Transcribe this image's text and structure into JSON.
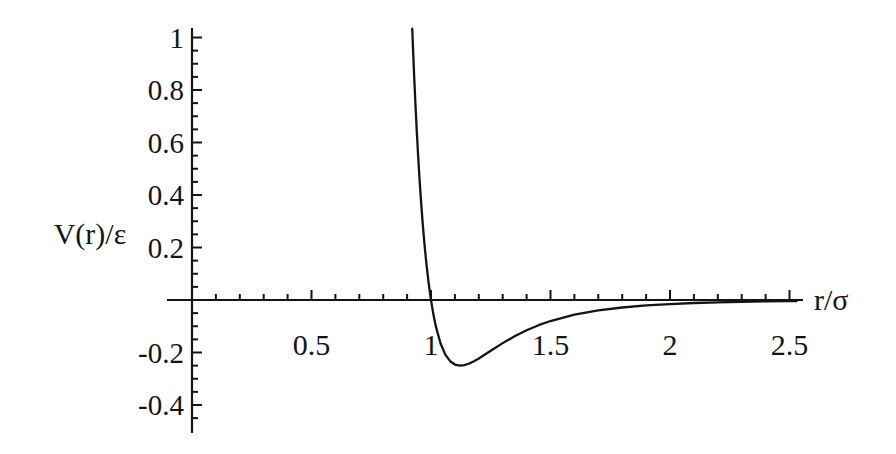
{
  "chart_data": {
    "type": "line",
    "title": "",
    "xlabel": "r/σ",
    "ylabel": "V(r)/ε",
    "xlim": [
      0,
      2.56
    ],
    "ylim": [
      -0.5,
      1.04
    ],
    "grid": false,
    "legend": null,
    "background_color": "#ffffff",
    "axis_color": "#141414",
    "curve_color": "#141414",
    "xticks": {
      "values": [
        0.5,
        1,
        1.5,
        2,
        2.5
      ],
      "labels": [
        "0.5",
        "1",
        "1.5",
        "2",
        "2.5"
      ],
      "minor_step": 0.1
    },
    "yticks": {
      "values": [
        1,
        0.8,
        0.6,
        0.4,
        0.2,
        -0.2,
        -0.4
      ],
      "labels": [
        "1",
        "0.8",
        "0.6",
        "0.4",
        "0.2",
        "-0.2",
        "-0.4"
      ],
      "minor_step": 0.05
    },
    "zero_crossing": 1.0,
    "minimum": {
      "x": 1.122,
      "y": -0.25
    },
    "series": [
      {
        "name": "Lennard-Jones potential",
        "points": [
          [
            0.9215,
            1.034
          ],
          [
            0.925,
            0.952
          ],
          [
            0.93,
            0.8435
          ],
          [
            0.935,
            0.7435
          ],
          [
            0.94,
            0.6517
          ],
          [
            0.945,
            0.5674
          ],
          [
            0.95,
            0.4903
          ],
          [
            0.955,
            0.4194
          ],
          [
            0.96,
            0.3545
          ],
          [
            0.965,
            0.2953
          ],
          [
            0.97,
            0.2407
          ],
          [
            0.975,
            0.1909
          ],
          [
            0.98,
            0.1455
          ],
          [
            0.985,
            0.1039
          ],
          [
            0.99,
            0.066
          ],
          [
            0.995,
            0.0315
          ],
          [
            1.0,
            0.0
          ],
          [
            1.01,
            -0.0546
          ],
          [
            1.02,
            -0.0995
          ],
          [
            1.04,
            -0.1657
          ],
          [
            1.06,
            -0.208
          ],
          [
            1.08,
            -0.2331
          ],
          [
            1.1,
            -0.2458
          ],
          [
            1.12,
            -0.25
          ],
          [
            1.14,
            -0.248
          ],
          [
            1.16,
            -0.242
          ],
          [
            1.18,
            -0.2332
          ],
          [
            1.2,
            -0.2227
          ],
          [
            1.25,
            -0.1934
          ],
          [
            1.3,
            -0.1643
          ],
          [
            1.35,
            -0.1379
          ],
          [
            1.4,
            -0.1152
          ],
          [
            1.45,
            -0.096
          ],
          [
            1.5,
            -0.0801
          ],
          [
            1.6,
            -0.056
          ],
          [
            1.7,
            -0.0397
          ],
          [
            1.8,
            -0.0286
          ],
          [
            1.9,
            -0.0208
          ],
          [
            2.0,
            -0.0154
          ],
          [
            2.1,
            -0.0115
          ],
          [
            2.2,
            -0.0087
          ],
          [
            2.3,
            -0.0067
          ],
          [
            2.4,
            -0.0052
          ],
          [
            2.5,
            -0.0041
          ],
          [
            2.53,
            -0.0038
          ]
        ]
      }
    ]
  }
}
